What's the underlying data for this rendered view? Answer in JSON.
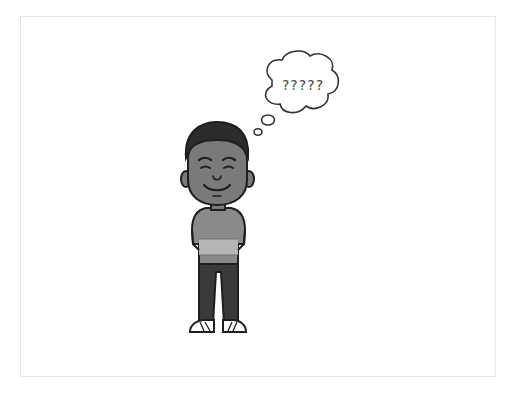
{
  "illustration": {
    "subject": "cartoon boy standing with hands behind back, smiling",
    "thought_bubble": {
      "text": "?????"
    },
    "colors": {
      "outline": "#1e1e1e",
      "skin": "#7a7a7a",
      "hair": "#2b2b2b",
      "shirt": "#8a8a8a",
      "shirt_stripe": "#b5b5b5",
      "pants": "#3a3a3a",
      "shoes": "#ffffff",
      "frame_border": "#e6e6e6"
    }
  }
}
